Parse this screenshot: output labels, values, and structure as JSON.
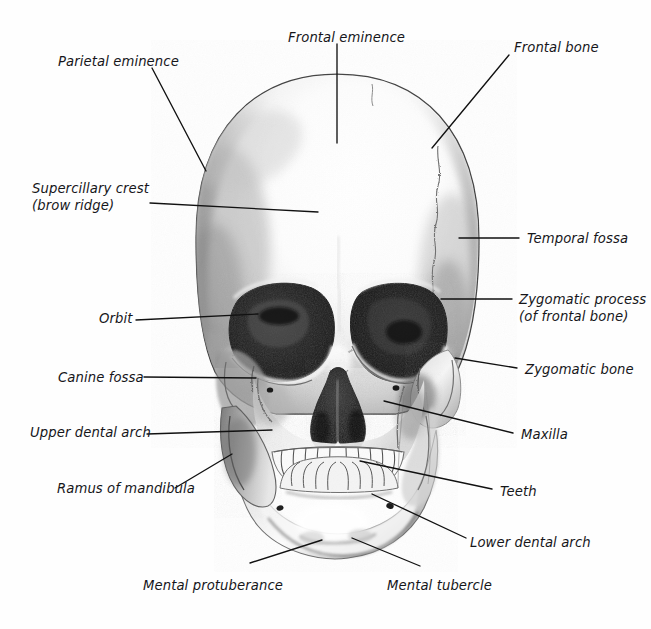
{
  "figure": {
    "view": "anterior (frontal)",
    "background_color": "#fefefe",
    "ink_color": "#16161a",
    "leader_color": "#111111",
    "medium": "pencil / graphite shaded illustration"
  },
  "labels": [
    {
      "id": "parietal-eminence",
      "text": "Parietal eminence",
      "text2": "",
      "x": 58,
      "y": 54,
      "align": "left"
    },
    {
      "id": "frontal-eminence",
      "text": "Frontal eminence",
      "text2": "",
      "x": 288,
      "y": 30,
      "align": "left"
    },
    {
      "id": "frontal-bone",
      "text": "Frontal bone",
      "text2": "",
      "x": 514,
      "y": 40,
      "align": "left"
    },
    {
      "id": "supercillary-crest",
      "text": "Supercillary crest",
      "text2": "(brow ridge)",
      "x": 32,
      "y": 181,
      "align": "left"
    },
    {
      "id": "temporal-fossa",
      "text": "Temporal fossa",
      "text2": "",
      "x": 527,
      "y": 231,
      "align": "left"
    },
    {
      "id": "zygomatic-process",
      "text": "Zygomatic process",
      "text2": "(of frontal bone)",
      "x": 519,
      "y": 292,
      "align": "left"
    },
    {
      "id": "orbit",
      "text": "Orbit",
      "text2": "",
      "x": 99,
      "y": 311,
      "align": "left"
    },
    {
      "id": "zygomatic-bone",
      "text": "Zygomatic bone",
      "text2": "",
      "x": 525,
      "y": 362,
      "align": "left"
    },
    {
      "id": "canine-fossa",
      "text": "Canine fossa",
      "text2": "",
      "x": 58,
      "y": 370,
      "align": "left"
    },
    {
      "id": "upper-dental-arch",
      "text": "Upper dental arch",
      "text2": "",
      "x": 30,
      "y": 425,
      "align": "left"
    },
    {
      "id": "maxilla",
      "text": "Maxilla",
      "text2": "",
      "x": 521,
      "y": 427,
      "align": "left"
    },
    {
      "id": "ramus-of-mandibula",
      "text": "Ramus of mandibula",
      "text2": "",
      "x": 57,
      "y": 481,
      "align": "left"
    },
    {
      "id": "teeth",
      "text": "Teeth",
      "text2": "",
      "x": 500,
      "y": 484,
      "align": "left"
    },
    {
      "id": "lower-dental-arch",
      "text": "Lower dental arch",
      "text2": "",
      "x": 470,
      "y": 535,
      "align": "left"
    },
    {
      "id": "mental-protuberance",
      "text": "Mental protuberance",
      "text2": "",
      "x": 143,
      "y": 578,
      "align": "left"
    },
    {
      "id": "mental-tubercle",
      "text": "Mental tubercle",
      "text2": "",
      "x": 387,
      "y": 578,
      "align": "left"
    }
  ],
  "leaders": [
    {
      "id": "leader-parietal-eminence",
      "from": [
        152,
        68
      ],
      "to": [
        206,
        171
      ]
    },
    {
      "id": "leader-frontal-eminence",
      "from": [
        337,
        44
      ],
      "to": [
        337,
        143
      ]
    },
    {
      "id": "leader-frontal-bone",
      "from": [
        509,
        55
      ],
      "to": [
        432,
        148
      ]
    },
    {
      "id": "leader-supercillary-crest",
      "from": [
        150,
        203
      ],
      "to": [
        318,
        212
      ]
    },
    {
      "id": "leader-temporal-fossa",
      "from": [
        519,
        238
      ],
      "to": [
        459,
        238
      ]
    },
    {
      "id": "leader-zygomatic-process",
      "from": [
        512,
        299
      ],
      "to": [
        441,
        299
      ]
    },
    {
      "id": "leader-orbit",
      "from": [
        136,
        320
      ],
      "to": [
        258,
        314
      ]
    },
    {
      "id": "leader-zygomatic-bone",
      "from": [
        517,
        368
      ],
      "to": [
        455,
        358
      ]
    },
    {
      "id": "leader-canine-fossa",
      "from": [
        144,
        377
      ],
      "to": [
        256,
        378
      ]
    },
    {
      "id": "leader-upper-dental-arch",
      "from": [
        147,
        434
      ],
      "to": [
        272,
        430
      ]
    },
    {
      "id": "leader-maxilla",
      "from": [
        513,
        433
      ],
      "to": [
        384,
        401
      ]
    },
    {
      "id": "leader-ramus",
      "from": [
        175,
        488
      ],
      "to": [
        232,
        454
      ]
    },
    {
      "id": "leader-teeth",
      "from": [
        492,
        489
      ],
      "to": [
        360,
        461
      ]
    },
    {
      "id": "leader-lower-dental-arch",
      "from": [
        466,
        538
      ],
      "to": [
        372,
        494
      ]
    },
    {
      "id": "leader-mental-protuberance",
      "from": [
        250,
        563
      ],
      "to": [
        322,
        540
      ]
    },
    {
      "id": "leader-mental-tubercle",
      "from": [
        420,
        566
      ],
      "to": [
        352,
        538
      ]
    }
  ],
  "anatomy_parts": [
    "cranium",
    "frontal bone",
    "coronal suture",
    "parietal eminence",
    "temporal fossa",
    "supraorbital margin",
    "orbit (left)",
    "orbit (right)",
    "nasal aperture",
    "nasal septum",
    "zygomatic bone",
    "zygomatic process",
    "maxilla",
    "upper teeth",
    "lower teeth",
    "mandible",
    "ramus of mandibula",
    "mental protuberance",
    "mental tubercle",
    "mental foramen"
  ]
}
